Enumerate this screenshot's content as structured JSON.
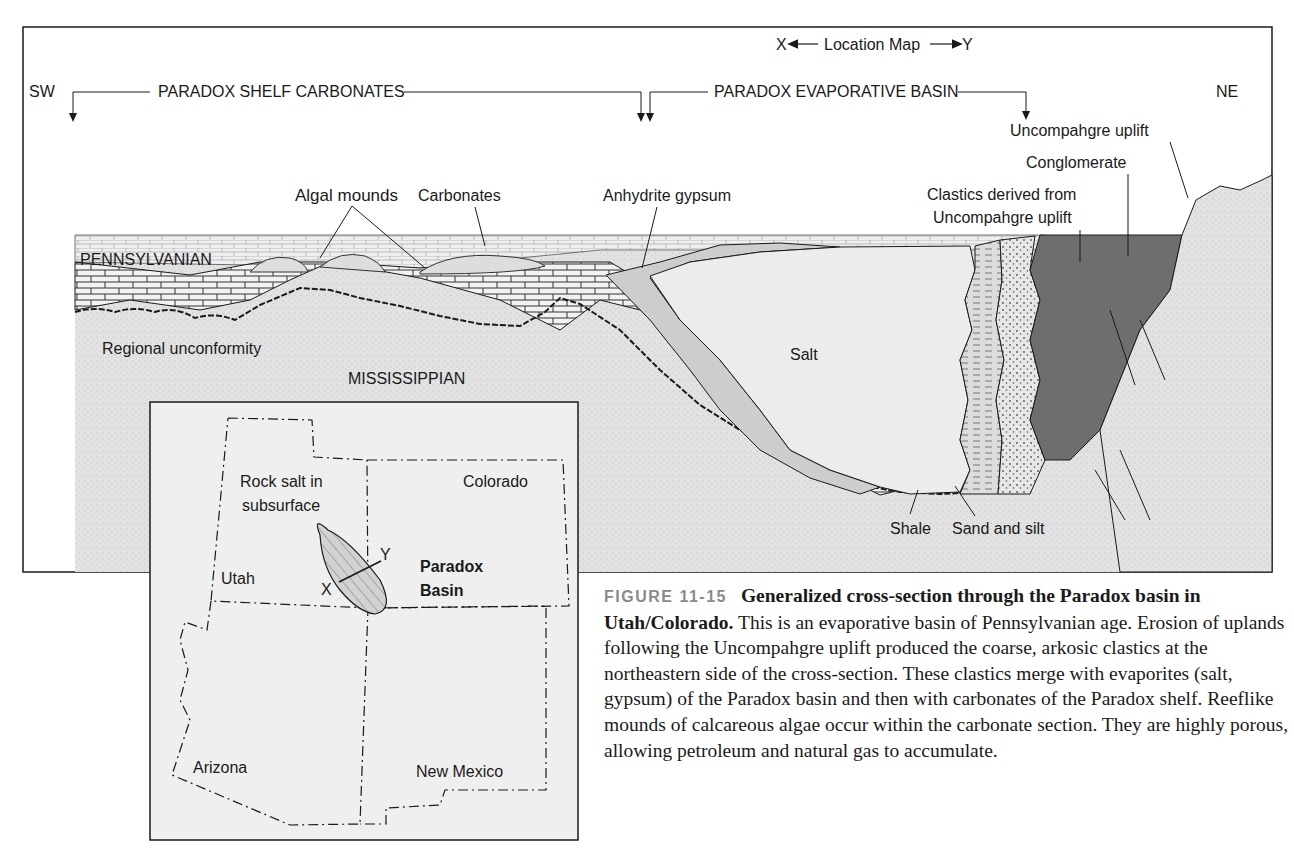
{
  "figure": {
    "number": "FIGURE 11-15",
    "title": "Generalized cross-section through the Paradox basin in Utah/Colorado.",
    "body": " This is an evaporative basin of Pennsylvanian age. Erosion of uplands following the Uncompahgre uplift produced the coarse, arkosic clastics at the northeastern side of the cross-section. These clastics merge with evaporites (salt, gypsum) of the Paradox basin and then with carbonates of the Paradox shelf. Reeflike mounds of calcareous algae occur within the carbonate section. They are highly porous, allowing petroleum and natural gas to accumulate."
  },
  "cross_section": {
    "location_map_label": "X◀— Location Map —▶Y",
    "location_x": "X",
    "location_text": "Location Map",
    "location_y": "Y",
    "sw": "SW",
    "ne": "NE",
    "shelf_header": "PARADOX SHELF CARBONATES",
    "basin_header": "PARADOX EVAPORATIVE BASIN",
    "labels": {
      "uncompahgre_uplift": "Uncompahgre uplift",
      "conglomerate": "Conglomerate",
      "clastics_line1": "Clastics derived from",
      "clastics_line2": "Uncompahgre uplift",
      "algal_mounds": "Algal mounds",
      "carbonates": "Carbonates",
      "anhydrite": "Anhydrite gypsum",
      "pennsylvanian": "PENNSYLVANIAN",
      "regional_unconformity": "Regional unconformity",
      "mississippian": "MISSISSIPPIAN",
      "salt": "Salt",
      "shale": "Shale",
      "sand_silt": "Sand and silt"
    }
  },
  "location_map": {
    "rock_salt_line1": "Rock salt in",
    "rock_salt_line2": "subsurface",
    "colorado": "Colorado",
    "utah": "Utah",
    "arizona": "Arizona",
    "new_mexico": "New Mexico",
    "paradox_line1": "Paradox",
    "paradox_line2": "Basin",
    "x": "X",
    "y": "Y"
  },
  "colors": {
    "stipple_bg": "#e4e4e4",
    "salt": "#ececec",
    "anhydrite": "#cfcfcf",
    "conglomerate": "#6e6e6e",
    "ink": "#1a1a1a",
    "map_bg": "#efefef"
  }
}
